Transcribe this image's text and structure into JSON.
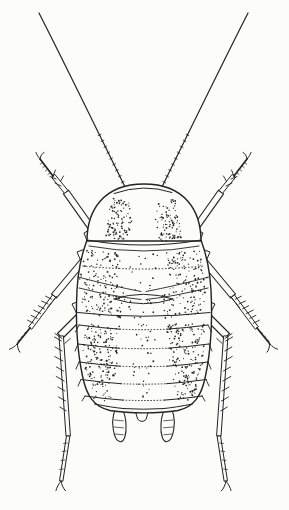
{
  "figure": {
    "colors": {
      "ink": "#232323",
      "paper": "#fcfcf9"
    }
  },
  "svg": {
    "viewbox": "0 0 289 510",
    "mirror_axis": 287,
    "paths": [
      {
        "name": "antenna",
        "d": "M 39,13 C 68,70 98,132 127,191",
        "w": 1.2,
        "fill": "none",
        "mirror": true
      },
      {
        "name": "antenna-segments",
        "d": "M 100.9,134.3 l -2.7,1.3 M 103.8,140.2 l -2.7,1.3 M 106.7,146.1 l -2.7,1.3 M 109.6,152 l -2.7,1.3 M 112.5,157.9 l -2.7,1.3 M 115.4,163.8 l -2.7,1.3 M 118.3,169.7 l -2.7,1.3 M 121.2,175.6 l -2.7,1.3 M 124.1,181.5 l -2.7,1.3",
        "w": 0.8,
        "fill": "none",
        "mirror": true
      },
      {
        "name": "front-coxa",
        "d": "M 90,248 L 84,233 L 91,229 L 97,244 Z",
        "w": 1,
        "fill": "paper",
        "mirror": true
      },
      {
        "name": "front-femur",
        "d": "M 97.6,231.2 L 92.4,234.9 L 63.4,193.9 L 68.6,190.2 Z",
        "w": 1.1,
        "fill": "paper",
        "mirror": true
      },
      {
        "name": "front-tibia",
        "d": "M 67.6,190.7 L 64.5,193.3 L 51.5,177.3 L 54.6,174.7 Z",
        "w": 1,
        "fill": "paper",
        "mirror": true
      },
      {
        "name": "front-leg-spines",
        "d": "M 56,179 l -6,-2.5 M 53,176 l 2.5,-6 M 61,186 l -6,-3 M 60.5,181.5 l 3,-5.5",
        "w": 0.9,
        "fill": "none",
        "mirror": true
      },
      {
        "name": "front-tarsus",
        "d": "M 53,176 L 40,159",
        "w": 1.7,
        "fill": "none",
        "mirror": true
      },
      {
        "name": "front-tarsus-segments",
        "d": "M 50.4,172.6 l -2.4,1.8 M 47.8,169.2 l -2.4,1.8 M 45.2,165.8 l -2.4,1.8 M 42.6,162.4 l -2.4,1.8",
        "w": 0.7,
        "fill": "none",
        "mirror": true
      },
      {
        "name": "front-claw",
        "d": "M 40,159 C 38,156.5 36.5,154.5 36,152.5 M 40,159 C 40.5,155.5 42,153.5 44,152.5",
        "w": 1,
        "fill": "none",
        "mirror": true
      },
      {
        "name": "middle-coxa",
        "d": "M 83,266 L 77,252 L 85,249 L 90,262 Z",
        "w": 1,
        "fill": "paper",
        "mirror": true
      },
      {
        "name": "middle-femur",
        "d": "M 86.5,262 L 81.5,258 L 51.5,294 L 56.5,298 Z",
        "w": 1.1,
        "fill": "paper",
        "mirror": true
      },
      {
        "name": "middle-tibia",
        "d": "M 55.4,297.1 L 52.6,294.9 L 28.6,326.9 L 31.4,329.1 Z",
        "w": 1,
        "fill": "paper",
        "mirror": true
      },
      {
        "name": "middle-leg-spines",
        "d": "M 51.6,299.2 l -6,-3 M 48,304 l -6.5,-3 M 44.4,308.8 l -6,-3 M 40.8,313.6 l -7,-3.5 M 37.2,318.4 l -6,-3 M 33.6,323.2 l -6,-3 M 52.5,301.5 l 4,-5 M 47.5,307.5 l 4,-5",
        "w": 0.9,
        "fill": "none",
        "mirror": true
      },
      {
        "name": "middle-tarsus",
        "d": "M 30,328 L 17.5,343.5",
        "w": 1.7,
        "fill": "none",
        "mirror": true
      },
      {
        "name": "middle-tarsus-segments",
        "d": "M 26.8,331.8 l -2.6,1.6 M 23.6,335.6 l -2.6,1.6 M 20.6,339.3 l -2.6,1.6",
        "w": 0.7,
        "fill": "none",
        "mirror": true
      },
      {
        "name": "middle-claw",
        "d": "M 17.5,343.5 C 14.5,346.8 12,348.6 9.5,349.2 M 17.5,343.5 C 17.4,347.4 18.3,350.2 20,352.2",
        "w": 1,
        "fill": "none",
        "mirror": true
      },
      {
        "name": "hind-coxa",
        "d": "M 80,320 L 72,304 L 82,300 L 90,316 Z",
        "w": 1,
        "fill": "paper",
        "mirror": true
      },
      {
        "name": "hind-femur",
        "d": "M 90.5,310.5 L 85.5,305.5 L 57.5,333.5 L 62.5,338.5 Z",
        "w": 1.1,
        "fill": "paper",
        "mirror": true
      },
      {
        "name": "hind-tibia",
        "d": "M 63,335.9 L 59,336.1 L 66,436.1 L 70,435.9 Z",
        "w": 1,
        "fill": "paper",
        "mirror": true
      },
      {
        "name": "hind-leg-spines",
        "d": "M 61.4,341 l -7,-4 M 62.1,351 l -7,-4 M 62.8,361 l -8,-4.5 M 63.5,371 l -7,-4 M 64.2,381 l -8,-4.5 M 64.9,391 l -7,-4 M 65.6,401 l -7,-4 M 66.3,411 l -6.5,-4 M 62,338.5 l -7,-5 M 64.8,343.5 l 5.5,-5",
        "w": 0.9,
        "fill": "none",
        "mirror": true
      },
      {
        "name": "hind-tarsus",
        "d": "M 69.5,436.2 L 66.5,435.8 L 59.5,480.8 L 62.5,481.2 Z",
        "w": 1,
        "fill": "paper",
        "mirror": true
      },
      {
        "name": "hind-tarsus-segments",
        "d": "M 67.4,443 l -3.8,0.5 M 66.2,451 l -3.8,0.5 M 64.8,460 l -3.8,0.5 M 63.4,469 l -3.8,0.5",
        "w": 0.7,
        "fill": "none",
        "mirror": true
      },
      {
        "name": "hind-claw",
        "d": "M 61,481 C 58.5,484.5 56.6,487.4 56,490.5 M 61,481 C 61.8,485.2 63.3,488.4 65.5,490.8",
        "w": 1,
        "fill": "none",
        "mirror": true
      },
      {
        "name": "cercus",
        "d": "M 118.2,408 C 113.8,409.2 111.6,418.5 113.2,429 C 114.2,436 116.8,441.3 120.2,441.7 C 124.2,442.1 126.6,434.5 126,424.5 C 125.5,415.5 123.3,408.3 118.2,408 Z",
        "w": 1.1,
        "fill": "paper",
        "mirror": true
      },
      {
        "name": "cercus-hairs",
        "d": "M 114.3,420 l 9,0.8 M 113.8,427 l 9.6,0.8 M 114.8,434 l 8.4,0.8",
        "w": 0.7,
        "fill": "none",
        "mirror": true
      },
      {
        "name": "supra-anal-plate",
        "d": "M 135,409 Q 142,410 149,409 L 146,419.5 Q 142,423.5 138,419.5 Z",
        "w": 1,
        "fill": "paper",
        "mirror": false
      },
      {
        "name": "body-outline",
        "d": "M 87,240 C 81,256 78,272 77,290 C 75.5,320 77,350 82.5,376 C 86.5,396 94,407 110,410.5 C 122,412.4 132,412.9 144,412.9 C 156,412.9 166,412.4 178,410.5 C 194,407 201.5,396 205.5,376 C 211,350 212.5,320 211,290 C 210,272 207,256 201,240 Z",
        "w": 1.4,
        "fill": "paper",
        "mirror": false
      },
      {
        "name": "pronotum",
        "d": "M 87,241 C 87,211 103,184 144,184 C 185,184 201,211 201,241 Z",
        "w": 1.4,
        "fill": "paper",
        "mirror": false
      },
      {
        "name": "head-margin",
        "d": "M 114,193.5 Q 144,183 172,192.5",
        "w": 1,
        "fill": "none",
        "mirror": false
      },
      {
        "name": "pronotum-hind-margin",
        "d": "M 87,240 Q 144,250 201,240",
        "w": 1.1,
        "fill": "none",
        "mirror": false
      },
      {
        "name": "mesonotum-front-margin",
        "d": "M 89,246 Q 144,256 199,246",
        "w": 0.9,
        "fill": "none",
        "mirror": false
      },
      {
        "name": "mesonotum-dotted-row",
        "d": "M 83,266 Q 143.5,272 204,266",
        "w": 1,
        "fill": "none",
        "dash": "0.7 2.6",
        "mirror": false
      },
      {
        "name": "wingpad-arc-upper",
        "d": "M 78,277 Q 112,286 141,291.5",
        "w": 0.9,
        "fill": "none",
        "mirror": true
      },
      {
        "name": "wingpad-arc-lower",
        "d": "M 79,288 Q 113,296.5 141,299.5",
        "w": 0.9,
        "fill": "none",
        "mirror": true
      },
      {
        "name": "metanotum-lens-top",
        "d": "M 114,299 Q 143.5,289.5 173,299",
        "w": 1,
        "fill": "none",
        "mirror": false
      },
      {
        "name": "metanotum-lens-bottom",
        "d": "M 114,299 Q 143.5,308.5 173,299",
        "w": 1,
        "fill": "none",
        "mirror": false
      },
      {
        "name": "metanotum-hind-margin",
        "d": "M 77.5,312.5 Q 143.5,320 210,312.5",
        "w": 1,
        "fill": "none",
        "mirror": false
      },
      {
        "name": "tergite-1-margin-sides",
        "d": "M 79,325 Q 102,328 120,329.2 M 208,325 Q 185,328 167,329.2",
        "w": 1,
        "fill": "none",
        "mirror": false
      },
      {
        "name": "tergite-1-margin-center",
        "d": "M 120,329.2 Q 143.5,330.2 167,329.2",
        "w": 1,
        "fill": "none",
        "dash": "0.7 2.4",
        "mirror": false
      },
      {
        "name": "tergite-2-margin-sides",
        "d": "M 78,344 Q 101,347 119,348.2 M 209,344 Q 186,347 168,348.2",
        "w": 1,
        "fill": "none",
        "mirror": false
      },
      {
        "name": "tergite-2-margin-center",
        "d": "M 119,348.2 Q 143.5,349.2 168,348.2",
        "w": 1,
        "fill": "none",
        "dash": "0.7 2.4",
        "mirror": false
      },
      {
        "name": "tergite-3-margin-sides",
        "d": "M 79,362 Q 102,365 120,366.2 M 208,362 Q 185,365 167,366.2",
        "w": 1,
        "fill": "none",
        "mirror": false
      },
      {
        "name": "tergite-3-margin-center",
        "d": "M 120,366.2 Q 143.5,367.2 167,366.2",
        "w": 1,
        "fill": "none",
        "dash": "0.7 2.4",
        "mirror": false
      },
      {
        "name": "tergite-4-margin-sides",
        "d": "M 81,379.5 Q 103,382.5 121,383.7 M 206.5,379.5 Q 184.5,382.5 166.5,383.7",
        "w": 1,
        "fill": "none",
        "mirror": false
      },
      {
        "name": "tergite-4-margin-center",
        "d": "M 121,383.7 Q 143.5,384.7 166.5,383.7",
        "w": 1,
        "fill": "none",
        "dash": "0.7 2.4",
        "mirror": false
      },
      {
        "name": "tergite-5-margin-sides",
        "d": "M 85,396 Q 106,399 123,400.1 M 202.5,396 Q 181.5,399 164.5,400.1",
        "w": 1,
        "fill": "none",
        "mirror": false
      },
      {
        "name": "tergite-5-margin-center",
        "d": "M 123,400.1 Q 143.5,401 164.5,400.1",
        "w": 1,
        "fill": "none",
        "dash": "0.7 2.4",
        "mirror": false
      },
      {
        "name": "tergite-6-margin-sides",
        "d": "M 94.5,404 Q 112,407.5 124,408.6 M 192.5,404 Q 175,407.5 163,408.6",
        "w": 1,
        "fill": "none",
        "mirror": false
      },
      {
        "name": "tergite-6-margin-center",
        "d": "M 124,408.6 Q 143.5,409.8 163,408.6",
        "w": 1,
        "fill": "none",
        "mirror": false
      },
      {
        "name": "tergite-side-folds",
        "d": "M 79,325 L 75.5,332 M 78,344 L 75,351 M 79,362 L 76,369 M 81,379.5 L 78,386 M 85,396 L 82,401",
        "w": 0.9,
        "fill": "none",
        "mirror": true
      }
    ],
    "stipple": [
      {
        "name": "pronotum-stipple-band",
        "poly": [
          [
            112,
            198
          ],
          [
            130,
            202
          ],
          [
            132,
            220
          ],
          [
            127,
            242
          ],
          [
            106,
            239
          ],
          [
            108,
            215
          ]
        ],
        "count": 95,
        "seed": 7,
        "mirror": true
      },
      {
        "name": "thorax-stipple-band",
        "poly": [
          [
            85,
            250
          ],
          [
            121,
            252
          ],
          [
            117,
            282
          ],
          [
            126,
            290
          ],
          [
            122,
            318
          ],
          [
            84,
            314
          ],
          [
            79,
            283
          ]
        ],
        "count": 150,
        "seed": 11,
        "mirror": true
      },
      {
        "name": "abdomen-stipple-band",
        "poly": [
          [
            83,
            323
          ],
          [
            121,
            323
          ],
          [
            117,
            370
          ],
          [
            111,
            402
          ],
          [
            93,
            399
          ],
          [
            83,
            364
          ]
        ],
        "count": 170,
        "seed": 13,
        "mirror": true
      },
      {
        "name": "thorax-median-stipple",
        "poly": [
          [
            129,
            252
          ],
          [
            158,
            252
          ],
          [
            157,
            318
          ],
          [
            129,
            318
          ]
        ],
        "count": 26,
        "seed": 17,
        "mirror": false
      },
      {
        "name": "abdomen-median-stipple",
        "poly": [
          [
            129,
            323
          ],
          [
            157,
            323
          ],
          [
            151,
            402
          ],
          [
            135,
            402
          ]
        ],
        "count": 30,
        "seed": 19,
        "mirror": false
      }
    ]
  }
}
